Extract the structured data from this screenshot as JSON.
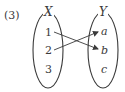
{
  "problem": {
    "number_label": "(3)"
  },
  "diagram": {
    "type": "mapping",
    "domain_set": {
      "name": "X",
      "elements": [
        "1",
        "2",
        "3"
      ]
    },
    "codomain_set": {
      "name": "Y",
      "elements": [
        "a",
        "b",
        "c"
      ]
    },
    "arrows": [
      {
        "from": "1",
        "to": "b"
      },
      {
        "from": "2",
        "to": "a"
      }
    ],
    "stroke_color": "#3a3a3a"
  }
}
